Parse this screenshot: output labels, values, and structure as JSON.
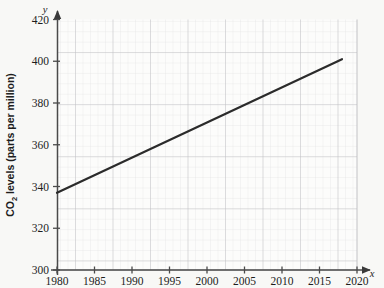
{
  "chart_data": {
    "type": "line",
    "title": "",
    "xlabel": "Year",
    "ylabel": "CO2 levels (parts per million)",
    "ylabel_prefix": "CO",
    "ylabel_subscript": "2",
    "ylabel_suffix": " levels (parts per million)",
    "x_axis_variable": "x",
    "y_axis_variable": "y",
    "xlim": [
      1980,
      2020
    ],
    "ylim": [
      300,
      420
    ],
    "x_ticks": [
      1980,
      1985,
      1990,
      1995,
      2000,
      2005,
      2010,
      2015,
      2020
    ],
    "y_ticks": [
      300,
      320,
      340,
      360,
      380,
      400,
      420
    ],
    "x_tick_labels": [
      "1980",
      "1985",
      "1990",
      "1995",
      "2000",
      "2005",
      "2010",
      "2015",
      "2020"
    ],
    "y_tick_labels": [
      "300",
      "320",
      "340",
      "360",
      "380",
      "400",
      "420"
    ],
    "x_minor_step": 1,
    "y_minor_step": 4,
    "grid": true,
    "grid_style": "graph-paper",
    "legend": false,
    "legend_position": "none",
    "series": [
      {
        "name": "CO2 levels",
        "points": [
          {
            "x": 1980,
            "y": 337
          },
          {
            "x": 2018,
            "y": 401
          }
        ],
        "color": "#2b2b2b",
        "line_width": 2.2
      }
    ],
    "annotations": []
  },
  "colors": {
    "background": "#f8f8f6",
    "plot_background": "#fcfcfb",
    "major_grid": "#b9b9bd",
    "minor_grid": "#e2e2e4",
    "axis": "#4a4a4a",
    "line": "#2b2b2b",
    "text": "#1d1d1d"
  }
}
